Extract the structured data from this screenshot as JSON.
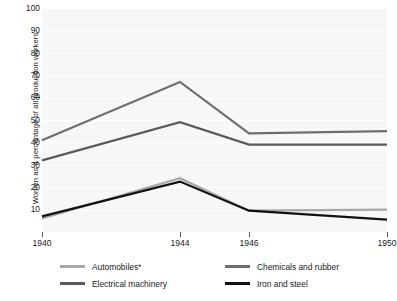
{
  "chart_data": {
    "type": "line",
    "title": "",
    "xlabel": "",
    "ylabel": "Women as a percentage of all production workers",
    "x": [
      1940,
      1944,
      1946,
      1950
    ],
    "xtick_labels": [
      "1940",
      "1944",
      "1946",
      "1950"
    ],
    "ytick_labels": [
      "10",
      "20",
      "30",
      "40",
      "50",
      "60",
      "70",
      "80",
      "90",
      "100"
    ],
    "yticks": [
      10,
      20,
      30,
      40,
      50,
      60,
      70,
      80,
      90,
      100
    ],
    "ylim": [
      0,
      100
    ],
    "xlim": [
      1940,
      1950
    ],
    "grid": "horizontal",
    "legend_position": "bottom",
    "series": [
      {
        "name": "Automobiles*",
        "color": "#a8a8a8",
        "values": [
          6,
          24,
          9.5,
          10
        ]
      },
      {
        "name": "Chemicals and rubber",
        "color": "#6e6e6e",
        "values": [
          41,
          67,
          44,
          45
        ]
      },
      {
        "name": "Electrical machinery",
        "color": "#5a5a5a",
        "values": [
          32,
          49,
          39,
          39
        ]
      },
      {
        "name": "Iron and steel",
        "color": "#111111",
        "values": [
          7,
          22.5,
          9.5,
          5.5
        ]
      }
    ]
  },
  "legend": {
    "items": [
      {
        "label": "Automobiles*",
        "color": "#a8a8a8"
      },
      {
        "label": "Chemicals and rubber",
        "color": "#6e6e6e"
      },
      {
        "label": "Electrical machinery",
        "color": "#5a5a5a"
      },
      {
        "label": "Iron and steel",
        "color": "#111111"
      }
    ]
  },
  "colors": {
    "plot_background": "#f7f7f7",
    "page_background": "#ffffff",
    "gridline": "#ffffff",
    "text": "#1a1a1a",
    "tick": "#555555"
  }
}
